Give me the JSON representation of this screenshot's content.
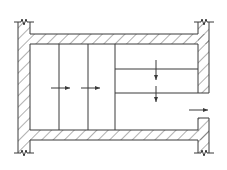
{
  "diagram": {
    "type": "plan-section",
    "colors": {
      "stroke": "#3a3a3a",
      "background": "#ffffff"
    },
    "walls": {
      "left": {
        "outer_x": 18,
        "inner_x": 30,
        "y_top": 22,
        "y_bottom": 153
      },
      "top_slab": {
        "x1": 30,
        "x2": 198,
        "y_top": 34,
        "y_bottom": 44
      },
      "bottom_slab": {
        "x1": 30,
        "x2": 198,
        "y_top": 130,
        "y_bottom": 140
      },
      "right_upper": {
        "inner_x": 198,
        "outer_x": 209,
        "y_top": 22,
        "y_bottom": 93
      },
      "right_lower": {
        "inner_x": 198,
        "outer_x": 209,
        "y_top": 118,
        "y_bottom": 153
      }
    },
    "partitions": {
      "vertical_x": [
        59,
        88,
        115
      ],
      "horizontal": [
        {
          "y": 69,
          "x1": 115,
          "x2": 198
        },
        {
          "y": 93,
          "x1": 115,
          "x2": 198
        }
      ]
    },
    "arrows": [
      {
        "id": "arrow-right-1",
        "direction": "right",
        "x1": 51,
        "y1": 88,
        "x2": 70,
        "y2": 88
      },
      {
        "id": "arrow-right-2",
        "direction": "right",
        "x1": 81,
        "y1": 88,
        "x2": 100,
        "y2": 88
      },
      {
        "id": "arrow-down-1",
        "direction": "down",
        "x1": 156,
        "y1": 60,
        "x2": 156,
        "y2": 80
      },
      {
        "id": "arrow-down-2",
        "direction": "down",
        "x1": 156,
        "y1": 86,
        "x2": 156,
        "y2": 102
      },
      {
        "id": "arrow-outlet",
        "direction": "right",
        "x1": 189,
        "y1": 110,
        "x2": 208,
        "y2": 110
      }
    ],
    "break_marks": [
      {
        "position": "top-left",
        "x": 24,
        "y": 22
      },
      {
        "position": "bottom-left",
        "x": 24,
        "y": 153
      },
      {
        "position": "top-right",
        "x": 203,
        "y": 22
      },
      {
        "position": "bottom-right",
        "x": 203,
        "y": 153
      }
    ]
  }
}
